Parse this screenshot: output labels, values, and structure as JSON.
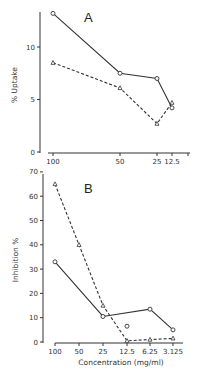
{
  "chart_data": [
    {
      "type": "line",
      "panel_label": "A",
      "title": "",
      "xlabel": "",
      "ylabel": "% Uptake",
      "categories": [
        "100",
        "50",
        "25",
        "12.5"
      ],
      "x_tick_labels": [
        "100",
        "50",
        "25",
        "12.5"
      ],
      "y_ticks": [
        0,
        5,
        10
      ],
      "ylim": [
        0,
        14
      ],
      "grid": false,
      "series": [
        {
          "name": "solid-circles",
          "style": "solid",
          "marker": "circle",
          "x": [
            "100",
            "50",
            "25",
            "12.5"
          ],
          "values": [
            13.2,
            7.5,
            7.0,
            4.2
          ]
        },
        {
          "name": "dashed-triangles",
          "style": "dashed",
          "marker": "triangle",
          "x": [
            "100",
            "50",
            "25",
            "12.5"
          ],
          "values": [
            8.5,
            6.1,
            2.7,
            4.7
          ]
        }
      ]
    },
    {
      "type": "line",
      "panel_label": "B",
      "title": "",
      "xlabel": "Concentration (mg/ml)",
      "ylabel": "Inhibition %",
      "categories": [
        "100",
        "50",
        "25",
        "12.5",
        "6.25",
        "3.125"
      ],
      "x_tick_labels": [
        "100",
        "50",
        "25",
        "12.5",
        "6.25",
        "3.125"
      ],
      "y_ticks": [
        0,
        10,
        20,
        30,
        40,
        50,
        60,
        70
      ],
      "ylim": [
        0,
        70
      ],
      "grid": false,
      "series": [
        {
          "name": "solid-circles",
          "style": "solid",
          "marker": "circle",
          "x": [
            "100",
            "25",
            "6.25",
            "3.125"
          ],
          "values": [
            33,
            10.5,
            13.5,
            5
          ]
        },
        {
          "name": "isolated-circle",
          "style": "none",
          "marker": "circle",
          "x": [
            "12.5"
          ],
          "values": [
            6.5
          ]
        },
        {
          "name": "dashed-triangles",
          "style": "dashed",
          "marker": "triangle",
          "x": [
            "100",
            "50",
            "25",
            "12.5",
            "6.25",
            "3.125"
          ],
          "values": [
            65,
            40,
            15,
            0.5,
            1,
            1.5
          ]
        }
      ]
    }
  ]
}
